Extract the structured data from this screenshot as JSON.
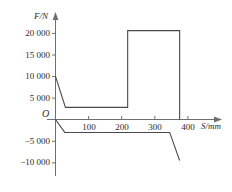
{
  "chart_data": {
    "type": "line",
    "title": "",
    "xlabel": "S/mm",
    "ylabel": "F/N",
    "origin_label": "O",
    "xlim": [
      -20,
      430
    ],
    "ylim": [
      -12000,
      23000
    ],
    "grid": false,
    "legend": "none",
    "x_ticks": [
      100,
      200,
      300,
      400
    ],
    "x_tick_labels": [
      "100",
      "200",
      "300",
      "400"
    ],
    "y_ticks": [
      -10000,
      -5000,
      5000,
      10000,
      15000,
      20000
    ],
    "y_tick_labels": [
      "−10 000",
      "−5 000",
      "5 000",
      "10 000",
      "15 000",
      "20 000"
    ],
    "series": [
      {
        "name": "upper-force-curve",
        "x": [
          0,
          30,
          218,
          218,
          375,
          375
        ],
        "y": [
          10000,
          2800,
          2800,
          20600,
          20600,
          0
        ]
      },
      {
        "name": "lower-force-curve",
        "x": [
          0,
          28,
          345,
          375
        ],
        "y": [
          0,
          -3000,
          -3000,
          -9500
        ]
      }
    ]
  },
  "axes": {
    "y_axis_title": "F/N",
    "x_axis_title": "S/mm",
    "origin": "O"
  }
}
